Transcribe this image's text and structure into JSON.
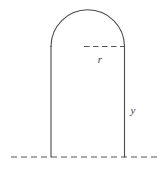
{
  "figure": {
    "kind": "geometry-diagram",
    "background_color": "#ffffff",
    "stroke_color": "#4a4a4a",
    "dash_color": "#555555",
    "label_color": "#3f3f3f",
    "stroke_width": 1.1,
    "canvas": {
      "width": 168,
      "height": 173
    },
    "labels": {
      "radius": "r",
      "height": "y"
    },
    "geometry": {
      "left_x": 51,
      "right_x": 124.5,
      "center_x": 87.75,
      "arch_base_y": 46.5,
      "arch_apex_y": 11,
      "baseline_y": 157,
      "radius_px": 36.75,
      "wall_height_px": 110.5,
      "baseline_start_x": 11,
      "baseline_end_x": 161,
      "radius_dash_start_x": 84,
      "radius_dash_end_x": 124.5
    },
    "label_positions": {
      "radius": {
        "x": 100,
        "y": 63
      },
      "height": {
        "x": 131,
        "y": 114
      }
    }
  }
}
